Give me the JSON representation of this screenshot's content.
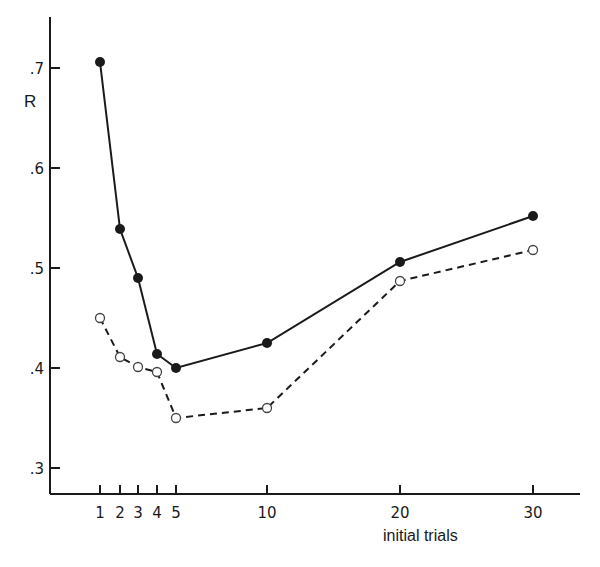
{
  "chart_data": {
    "type": "line",
    "title": "",
    "xlabel": "initial trials",
    "ylabel": "R",
    "x": [
      1,
      2,
      3,
      4,
      5,
      10,
      20,
      30
    ],
    "x_tick_labels": [
      "1",
      "2",
      "3",
      "4",
      "5",
      "10",
      "20",
      "30"
    ],
    "y_ticks": [
      0.3,
      0.4,
      0.5,
      0.6,
      0.7
    ],
    "y_tick_labels": [
      ".3",
      ".4",
      ".5",
      ".6",
      ".7"
    ],
    "ylim": [
      0.275,
      0.75
    ],
    "grid": false,
    "legend": null,
    "series": [
      {
        "name": "filled circles (solid line)",
        "marker": "filled-circle",
        "line_style": "solid",
        "values": [
          0.706,
          0.539,
          0.49,
          0.414,
          0.4,
          0.425,
          0.506,
          0.552
        ]
      },
      {
        "name": "open circles (dashed line)",
        "marker": "open-circle",
        "line_style": "dashed",
        "values": [
          0.45,
          0.411,
          0.401,
          0.396,
          0.35,
          0.36,
          0.487,
          0.518
        ]
      }
    ]
  },
  "labels": {
    "ylabel": "R",
    "xlabel": "initial trials"
  },
  "colors": {
    "ink": "#1a1a1a",
    "background": "#ffffff"
  }
}
